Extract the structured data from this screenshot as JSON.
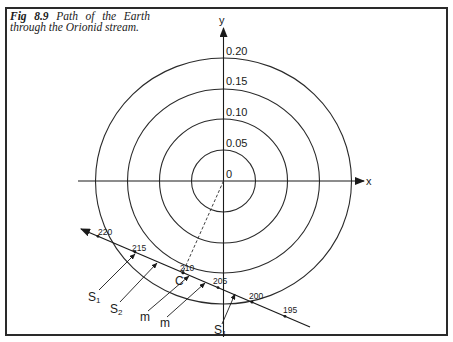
{
  "figure": {
    "label": "Fig 8.9",
    "caption": "Path of the Earth through the Orionid stream."
  },
  "axes": {
    "x_label": "x",
    "y_label": "y",
    "origin_label": "0"
  },
  "circles": [
    {
      "value": "0.05"
    },
    {
      "value": "0.10"
    },
    {
      "value": "0.15"
    },
    {
      "value": "0.20"
    }
  ],
  "path": {
    "date_ticks": [
      "220",
      "215",
      "210",
      "205",
      "200",
      "195"
    ],
    "closest_point_label": "C"
  },
  "stream_markers": [
    {
      "label": "S",
      "sub": "1"
    },
    {
      "label": "S",
      "sub": "2"
    },
    {
      "label": "m",
      "sub": ""
    },
    {
      "label": "m",
      "sub": ""
    },
    {
      "label": "S",
      "sub": "1"
    }
  ]
}
